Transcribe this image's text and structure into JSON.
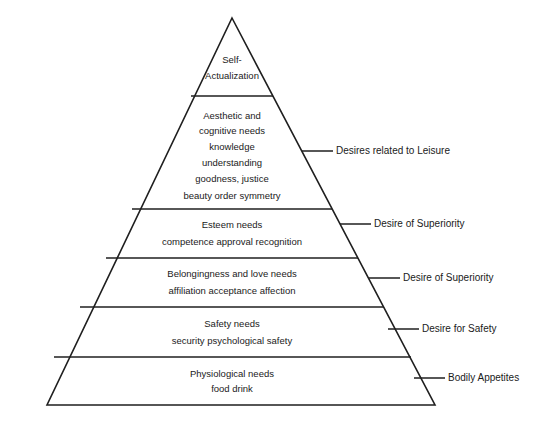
{
  "diagram": {
    "type": "pyramid",
    "stroke_color": "#1f1f1f",
    "background_color": "#ffffff",
    "text_color": "#1a1a1a",
    "tiers": [
      {
        "index": 1,
        "heading_line1": "Self-",
        "heading_line2": "Actualization",
        "items": []
      },
      {
        "index": 2,
        "heading_line1": "Aesthetic and",
        "heading_line2": "cognitive needs",
        "items": [
          "knowledge",
          "understanding",
          "goodness, justice",
          "beauty    order    symmetry"
        ]
      },
      {
        "index": 3,
        "heading_line1": "Esteem needs",
        "heading_line2": "",
        "items": [
          "competence   approval   recognition"
        ]
      },
      {
        "index": 4,
        "heading_line1": "Belongingness and love needs",
        "heading_line2": "",
        "items": [
          "affiliation   acceptance  affection"
        ]
      },
      {
        "index": 5,
        "heading_line1": "Safety needs",
        "heading_line2": "",
        "items": [
          "security   psychological safety"
        ]
      },
      {
        "index": 6,
        "heading_line1": "Physiological needs",
        "heading_line2": "",
        "items": [
          "food    drink"
        ]
      }
    ],
    "annotations": [
      {
        "index": 1,
        "label": "Desires related to Leisure"
      },
      {
        "index": 2,
        "label": "Desire of Superiority"
      },
      {
        "index": 3,
        "label": "Desire of Superiority"
      },
      {
        "index": 4,
        "label": "Desire for Safety"
      },
      {
        "index": 5,
        "label": "Bodily Appetites"
      }
    ]
  }
}
